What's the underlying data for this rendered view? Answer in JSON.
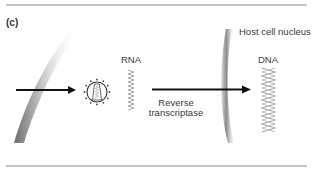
{
  "figure": {
    "panel_label": "(c)",
    "labels": {
      "rna": "RNA",
      "dna": "DNA",
      "nucleus": "Host cell nucleus",
      "enzyme_line1": "Reverse",
      "enzyme_line2": "transcriptase"
    },
    "icons": {
      "cell_membrane": "cell-membrane-icon",
      "virus": "retrovirus-icon",
      "rna_strand": "rna-strand-icon",
      "nuclear_membrane": "nuclear-membrane-icon",
      "dna_helix": "dna-helix-icon"
    },
    "colors": {
      "border": "#8a8a8a",
      "arrow": "#111111",
      "membrane": "#9a9a9a",
      "helix": "#a8a8a8",
      "text": "#3a3a3a"
    }
  }
}
